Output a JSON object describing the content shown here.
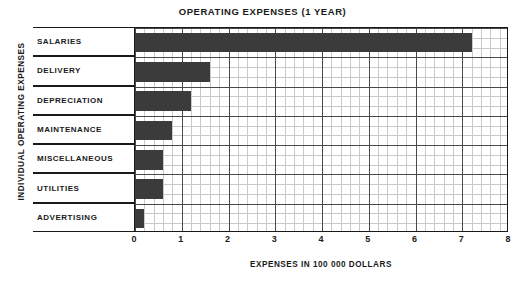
{
  "chart_data": {
    "type": "bar",
    "orientation": "horizontal",
    "title": "OPERATING EXPENSES (1 YEAR)",
    "xlabel": "EXPENSES IN 100 000 DOLLARS",
    "ylabel": "INDIVIDUAL OPERATING EXPENSES",
    "categories": [
      "SALARIES",
      "DELIVERY",
      "DEPRECIATION",
      "MAINTENANCE",
      "MISCELLANEOUS",
      "UTILITIES",
      "ADVERTISING"
    ],
    "values": [
      7.2,
      1.6,
      1.2,
      0.8,
      0.6,
      0.6,
      0.2
    ],
    "xlim": [
      0,
      8
    ],
    "xticks": [
      "0",
      "1",
      "2",
      "3",
      "4",
      "5",
      "6",
      "7",
      "8"
    ],
    "xtick_values": [
      0,
      1,
      2,
      3,
      4,
      5,
      6,
      7,
      8
    ],
    "minor_tick_step": 0.2,
    "grid": true,
    "legend": "none",
    "bar_color": "#3b3b3b",
    "grid_minor_color": "#c9c9c9",
    "grid_major_color": "#4a4a4a",
    "axis_color": "#1a1a1a",
    "background_color": "#ffffff"
  }
}
